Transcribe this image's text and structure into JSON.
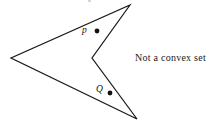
{
  "figure": {
    "caption": "Not a convex set",
    "background_color": "#ffffff",
    "stroke_color": "#1a1a1a",
    "point_color": "#111111",
    "width": 218,
    "height": 123
  },
  "labels": {
    "p": "p",
    "Q": "Q"
  },
  "geometry": {
    "description": "Concave arrowhead polygon with a reflex vertex on the right side",
    "polygon_points": "130,5 92,58 137,119 11,58",
    "vertices": [
      {
        "name": "top-right-tip",
        "x": 130,
        "y": 5
      },
      {
        "name": "reflex-notch",
        "x": 92,
        "y": 58
      },
      {
        "name": "bottom-right-tip",
        "x": 137,
        "y": 119
      },
      {
        "name": "left-tip",
        "x": 11,
        "y": 58
      }
    ],
    "points": [
      {
        "name": "p",
        "x": 97,
        "y": 31,
        "radius": 2.4
      },
      {
        "name": "Q",
        "x": 110,
        "y": 93,
        "radius": 2.4
      }
    ]
  }
}
